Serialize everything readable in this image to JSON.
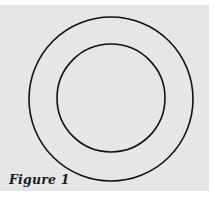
{
  "figure": {
    "caption": "Figure 1",
    "background_color": "#e6e6e6",
    "stroke_color": "#111111",
    "circles": [
      {
        "name": "outer-circle",
        "cx": 111,
        "cy": 99,
        "r": 82
      },
      {
        "name": "inner-circle",
        "cx": 111,
        "cy": 98,
        "r": 54
      }
    ]
  }
}
